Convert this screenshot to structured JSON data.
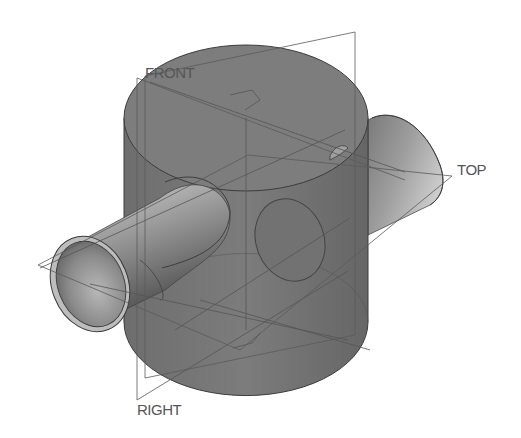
{
  "viewport": {
    "background": "#ffffff",
    "datum_planes": [
      {
        "name": "FRONT",
        "label": "FRONT"
      },
      {
        "name": "TOP",
        "label": "TOP"
      },
      {
        "name": "RIGHT",
        "label": "RIGHT"
      }
    ]
  },
  "model": {
    "features": [
      "main-cylinder",
      "through-pipe",
      "pipe-bore"
    ],
    "colors": {
      "body": "#7a7a7a",
      "body_dark": "#5e5e5e",
      "pipe_light": "#c8c8c8",
      "pipe_mid": "#8e8e8e",
      "pipe_dark": "#555555",
      "edge": "#3c3c3c",
      "datum_line": "#5a5a5a"
    }
  }
}
